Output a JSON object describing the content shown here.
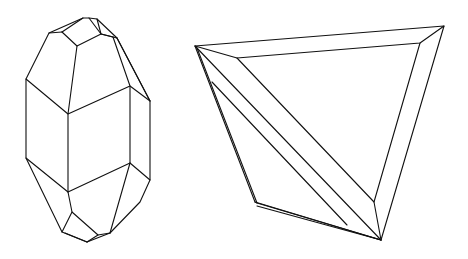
{
  "figure": {
    "stroke_color": "#111111",
    "background": "#ffffff",
    "crystals": [
      {
        "name": "elongated-prismatic-crystal",
        "position": "left"
      },
      {
        "name": "tabular-triangular-crystal",
        "position": "right"
      }
    ]
  }
}
